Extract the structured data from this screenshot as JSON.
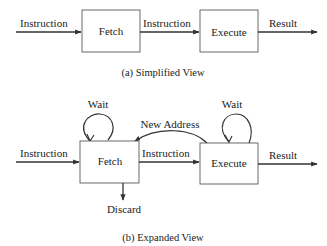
{
  "simplified": {
    "caption": "(a) Simplified View",
    "input_label": "Instruction",
    "fetch_label": "Fetch",
    "middle_label": "Instruction",
    "execute_label": "Execute",
    "output_label": "Result"
  },
  "expanded": {
    "caption": "(b) Expanded View",
    "input_label": "Instruction",
    "fetch_label": "Fetch",
    "middle_label": "Instruction",
    "execute_label": "Execute",
    "output_label": "Result",
    "fetch_loop_label": "Wait",
    "execute_loop_label": "Wait",
    "feedback_label": "New Address",
    "discard_label": "Discard"
  },
  "colors": {
    "stroke": "#333333",
    "text": "#222222",
    "background": "#ffffff"
  }
}
